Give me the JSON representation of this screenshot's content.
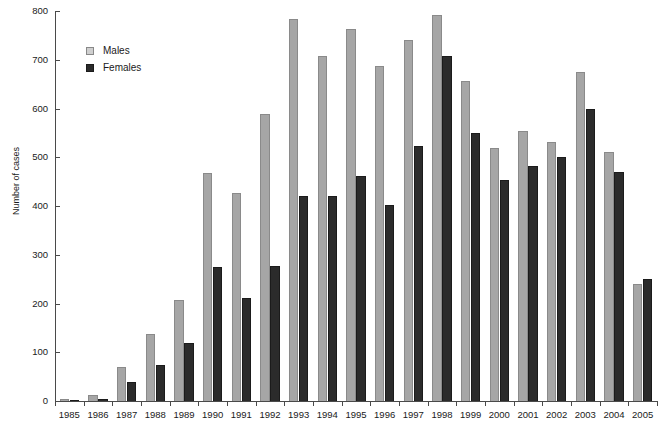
{
  "chart_data": {
    "type": "bar",
    "title": "",
    "xlabel": "",
    "ylabel": "Number of cases",
    "ylim": [
      0,
      800
    ],
    "ytick_step": 100,
    "yticks": [
      "0",
      "100",
      "200",
      "300",
      "400",
      "500",
      "600",
      "700",
      "800"
    ],
    "grid": false,
    "legend_position": "upper-left-inside",
    "categories": [
      "1985",
      "1986",
      "1987",
      "1988",
      "1989",
      "1990",
      "1991",
      "1992",
      "1993",
      "1994",
      "1995",
      "1996",
      "1997",
      "1998",
      "1999",
      "2000",
      "2001",
      "2002",
      "2003",
      "2004",
      "2005"
    ],
    "series": [
      {
        "name": "Males",
        "color": "#a6a6a6",
        "values": [
          5,
          12,
          70,
          138,
          207,
          467,
          426,
          588,
          783,
          708,
          763,
          687,
          741,
          791,
          657,
          519,
          553,
          531,
          675,
          510,
          240
        ]
      },
      {
        "name": "Females",
        "color": "#2b2b2b",
        "values": [
          2,
          4,
          38,
          74,
          118,
          274,
          212,
          277,
          421,
          420,
          461,
          403,
          523,
          707,
          550,
          453,
          483,
          501,
          598,
          469,
          250
        ]
      }
    ]
  },
  "legend": {
    "items": [
      {
        "label": "Males",
        "swatch": "males-swatch-icon"
      },
      {
        "label": "Females",
        "swatch": "females-swatch-icon"
      }
    ]
  },
  "title_sliver": {
    "text": ""
  }
}
